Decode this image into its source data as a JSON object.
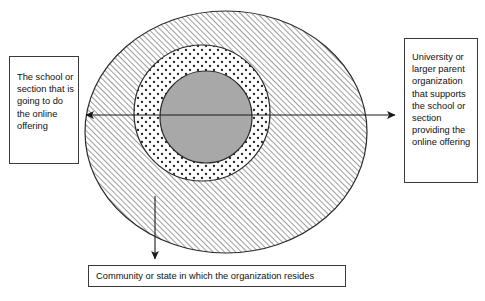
{
  "diagram": {
    "type": "nested-ellipse-venn",
    "background_color": "#ffffff",
    "regions": [
      {
        "id": "outer",
        "name": "community-or-state-region",
        "fill": "diagonal-hatch",
        "fill_color": "#ffffff",
        "line_color": "#2b2b2b",
        "cx": 226,
        "cy": 132,
        "rx": 141,
        "ry": 121
      },
      {
        "id": "middle",
        "name": "university-or-parent-organization-region",
        "fill": "dotted",
        "fill_color": "#ffffff",
        "line_color": "#2b2b2b",
        "cx": 202,
        "cy": 113,
        "rx": 68,
        "ry": 68
      },
      {
        "id": "inner",
        "name": "school-or-section-region",
        "fill": "solid",
        "fill_color": "#a8a8a8",
        "line_color": "#2b2b2b",
        "cx": 206,
        "cy": 117,
        "rx": 46,
        "ry": 46
      }
    ],
    "arrows": [
      {
        "id": "arrow-left",
        "direction": "left",
        "from_x": 206,
        "from_y": 115,
        "to_x": 82,
        "to_y": 115
      },
      {
        "id": "arrow-right",
        "direction": "right",
        "from_x": 206,
        "from_y": 115,
        "to_x": 399,
        "to_y": 115
      },
      {
        "id": "arrow-down",
        "direction": "down",
        "from_x": 155,
        "from_y": 196,
        "to_x": 155,
        "to_y": 263
      }
    ]
  },
  "callouts": {
    "left": {
      "name": "callout-school-or-section",
      "text": "The school or section that is going to do the online offering"
    },
    "right": {
      "name": "callout-university-or-parent",
      "text": "University or larger parent organization that supports the school or section providing the online offering"
    },
    "bottom": {
      "name": "callout-community-or-state",
      "text": "Community or state in which the organization resides"
    }
  }
}
